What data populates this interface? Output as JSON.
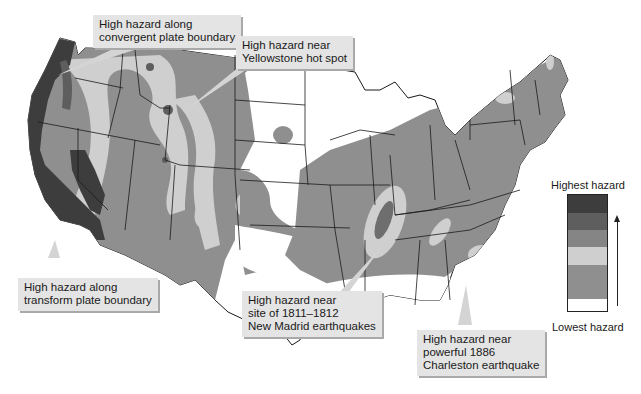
{
  "callouts": [
    {
      "id": "convergent",
      "lines": [
        "High hazard along",
        "convergent plate boundary"
      ]
    },
    {
      "id": "yellowstone",
      "lines": [
        "High hazard near",
        "Yellowstone hot spot"
      ]
    },
    {
      "id": "transform",
      "lines": [
        "High hazard along",
        "transform plate boundary"
      ]
    },
    {
      "id": "new-madrid",
      "lines": [
        "High hazard near",
        "site of 1811–1812",
        "New Madrid earthquakes"
      ]
    },
    {
      "id": "charleston",
      "lines": [
        "High hazard near",
        "powerful 1886",
        "Charleston earthquake"
      ]
    }
  ],
  "legend": {
    "top_label": "Highest hazard",
    "bottom_label": "Lowest hazard",
    "levels": [
      {
        "rank": 6,
        "color": "#3d3d3d"
      },
      {
        "rank": 5,
        "color": "#5e5e5e"
      },
      {
        "rank": 4,
        "color": "#858585"
      },
      {
        "rank": 3,
        "color": "#cfcfcf"
      },
      {
        "rank": 2,
        "color": "#8f8f8f"
      },
      {
        "rank": 1,
        "color": "#ffffff"
      }
    ],
    "arrow_direction": "up"
  },
  "colors": {
    "background": "#ffffff",
    "highest": "#3d3d3d",
    "high": "#5e5e5e",
    "moderate": "#858585",
    "light_band": "#cfcfcf",
    "low": "#8f8f8f",
    "lowest": "#ffffff",
    "state_border": "#1a1a1a",
    "callout_fill": "#e4e4e4",
    "callout_shadow": "#a9a9a9"
  }
}
